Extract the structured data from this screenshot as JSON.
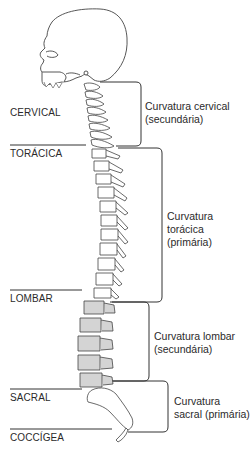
{
  "diagram": {
    "type": "anatomical-illustration",
    "colors": {
      "line": "#333333",
      "bone_fill": "#ffffff",
      "lumbar_fill": "#d4d4d4",
      "text": "#2a2a2a"
    },
    "regions": [
      {
        "label": "CERVICAL"
      },
      {
        "label": "TORÁCICA"
      },
      {
        "label": "LOMBAR"
      },
      {
        "label": "SACRAL"
      },
      {
        "label": "COCCÍGEA"
      }
    ],
    "curvatures": [
      {
        "line1": "Curvatura cervical",
        "line2": "(secundária)"
      },
      {
        "line1": "Curvatura",
        "line2": "torácica",
        "line3": "(primária)"
      },
      {
        "line1": "Curvatura lombar",
        "line2": "(secundária)"
      },
      {
        "line1": "Curvatura",
        "line2": "sacral (primária)"
      }
    ]
  }
}
